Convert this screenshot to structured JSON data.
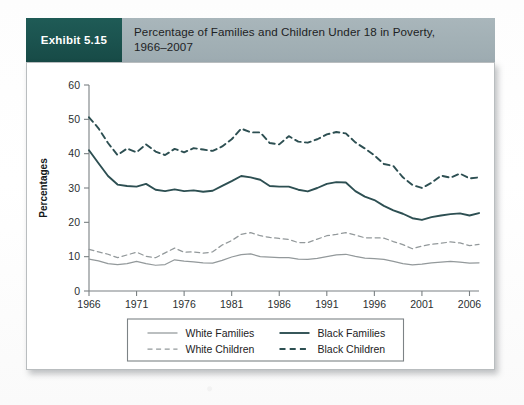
{
  "exhibit": {
    "tag": "Exhibit 5.15",
    "title_line1": "Percentage of Families and Children Under 18 in Poverty,",
    "title_line2": "1966–2007"
  },
  "colors": {
    "exhibit_tag_bg": "#1b534f",
    "header_band_bg": "#a2b0b5",
    "panel_bg": "#ffffff",
    "black_series": "#2d4f52",
    "white_series": "#93999b",
    "axis": "#7a8083",
    "text": "#1d2224"
  },
  "chart_data": {
    "type": "line",
    "title": "Percentage of Families and Children Under 18 in Poverty, 1966–2007",
    "xlabel": "",
    "ylabel": "Percentages",
    "xlim": [
      1966,
      2007
    ],
    "ylim": [
      0,
      60
    ],
    "yticks": [
      0,
      10,
      20,
      30,
      40,
      50,
      60
    ],
    "xticks": [
      1966,
      1971,
      1976,
      1981,
      1986,
      1991,
      1996,
      2001,
      2006
    ],
    "grid": false,
    "legend_position": "below-axes",
    "x": [
      1966,
      1967,
      1968,
      1969,
      1970,
      1971,
      1972,
      1973,
      1974,
      1975,
      1976,
      1977,
      1978,
      1979,
      1980,
      1981,
      1982,
      1983,
      1984,
      1985,
      1986,
      1987,
      1988,
      1989,
      1990,
      1991,
      1992,
      1993,
      1994,
      1995,
      1996,
      1997,
      1998,
      1999,
      2000,
      2001,
      2002,
      2003,
      2004,
      2005,
      2006,
      2007
    ],
    "series": [
      {
        "name": "Black Children",
        "style": "dashed",
        "color": "#2d4f52",
        "values": [
          50.6,
          47.4,
          43.1,
          39.6,
          41.5,
          40.4,
          42.7,
          40.6,
          39.6,
          41.4,
          40.4,
          41.6,
          41.2,
          40.8,
          42.1,
          44.2,
          47.3,
          46.2,
          46.2,
          43.1,
          42.7,
          45.1,
          43.5,
          43.2,
          44.2,
          45.6,
          46.3,
          45.9,
          43.3,
          41.5,
          39.5,
          37.0,
          36.4,
          33.1,
          30.9,
          30.0,
          31.5,
          33.6,
          33.0,
          34.2,
          32.8,
          33.1
        ]
      },
      {
        "name": "Black Families",
        "style": "solid",
        "color": "#2d4f52",
        "values": [
          41.0,
          37.2,
          33.5,
          31.0,
          30.6,
          30.4,
          31.2,
          29.5,
          29.1,
          29.6,
          29.1,
          29.3,
          28.9,
          29.2,
          30.6,
          32.0,
          33.5,
          33.1,
          32.4,
          30.6,
          30.4,
          30.4,
          29.5,
          29.0,
          30.0,
          31.2,
          31.7,
          31.6,
          29.1,
          27.5,
          26.5,
          24.8,
          23.5,
          22.5,
          21.2,
          20.7,
          21.5,
          22.0,
          22.4,
          22.6,
          22.0,
          22.7
        ]
      },
      {
        "name": "White Children",
        "style": "dashed",
        "color": "#93999b",
        "values": [
          12.1,
          11.4,
          10.7,
          9.7,
          10.5,
          11.3,
          10.1,
          9.7,
          11.1,
          12.5,
          11.3,
          11.4,
          11.0,
          11.4,
          13.4,
          14.7,
          16.5,
          17.0,
          16.1,
          15.6,
          15.3,
          15.0,
          14.1,
          14.1,
          15.1,
          16.1,
          16.5,
          17.0,
          16.3,
          15.5,
          15.5,
          15.4,
          14.4,
          13.5,
          12.3,
          13.1,
          13.6,
          13.9,
          14.3,
          14.0,
          13.2,
          13.6
        ]
      },
      {
        "name": "White Families",
        "style": "solid",
        "color": "#93999b",
        "values": [
          9.3,
          8.8,
          8.0,
          7.7,
          8.0,
          8.6,
          8.0,
          7.5,
          7.7,
          9.1,
          8.7,
          8.5,
          8.2,
          8.1,
          8.9,
          9.9,
          10.6,
          10.8,
          10.0,
          9.9,
          9.7,
          9.7,
          9.3,
          9.2,
          9.5,
          10.0,
          10.5,
          10.7,
          10.1,
          9.6,
          9.4,
          9.2,
          8.6,
          8.0,
          7.6,
          7.8,
          8.2,
          8.4,
          8.6,
          8.4,
          8.1,
          8.2
        ]
      }
    ],
    "legend_entries": [
      {
        "label": "White Families",
        "style": "solid",
        "weight": "thin"
      },
      {
        "label": "Black Families",
        "style": "solid",
        "weight": "thick"
      },
      {
        "label": "White Children",
        "style": "dashed",
        "weight": "thin"
      },
      {
        "label": "Black Children",
        "style": "dashed",
        "weight": "thick"
      }
    ]
  }
}
